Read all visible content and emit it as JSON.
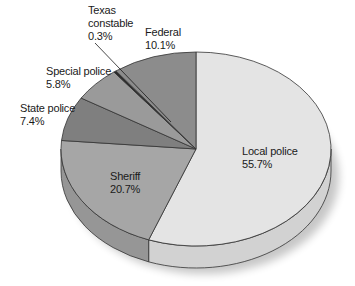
{
  "chart_data": {
    "type": "pie",
    "style": "3d-pie",
    "title": "",
    "unit": "%",
    "start_angle_deg": 0,
    "direction": "clockwise",
    "slices": [
      {
        "name": "Local police",
        "label_line1": "Local police",
        "value": 55.7,
        "value_label": "55.7%",
        "color": "#e4e4e4",
        "side_color": "#d2d2d2"
      },
      {
        "name": "Sheriff",
        "label_line1": "Sheriff",
        "value": 20.7,
        "value_label": "20.7%",
        "color": "#a6a6a6",
        "side_color": "#969696"
      },
      {
        "name": "State police",
        "label_line1": "State police",
        "value": 7.4,
        "value_label": "7.4%",
        "color": "#7f7f7f",
        "side_color": "#707070"
      },
      {
        "name": "Special police",
        "label_line1": "Special police",
        "value": 5.8,
        "value_label": "5.8%",
        "color": "#9a9a9a",
        "side_color": "#8a8a8a"
      },
      {
        "name": "Texas constable",
        "label_line1": "Texas",
        "label_line2": "constable",
        "value": 0.3,
        "value_label": "0.3%",
        "color": "#2a2a2a",
        "side_color": "#2a2a2a"
      },
      {
        "name": "Federal",
        "label_line1": "Federal",
        "value": 10.1,
        "value_label": "10.1%",
        "color": "#8c8c8c",
        "side_color": "#7c7c7c"
      }
    ],
    "legend": "none (labels placed on/near slices)"
  },
  "labels": {
    "local": {
      "line1": "Local police",
      "line2": "55.7%"
    },
    "sheriff": {
      "line1": "Sheriff",
      "line2": "20.7%"
    },
    "state": {
      "line1": "State police",
      "line2": "7.4%"
    },
    "special": {
      "line1": "Special police",
      "line2": "5.8%"
    },
    "texas": {
      "line1": "Texas",
      "line2": "constable",
      "line3": "0.3%"
    },
    "federal": {
      "line1": "Federal",
      "line2": "10.1%"
    }
  }
}
